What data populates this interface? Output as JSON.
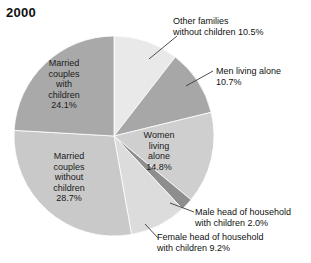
{
  "chart_data": {
    "type": "pie",
    "title": "2000",
    "xlabel": "",
    "ylabel": "",
    "legend_position": "none",
    "grid": false,
    "categories": [
      "Other families without children",
      "Men living alone",
      "Women living alone",
      "Male head of household with children",
      "Female head of household with children",
      "Married couples without children",
      "Married couples with children"
    ],
    "values": [
      10.5,
      10.7,
      14.8,
      2.0,
      9.2,
      28.7,
      24.1
    ],
    "value_suffix": "%",
    "start_angle_deg": 0,
    "direction": "clockwise",
    "center": {
      "x": 114,
      "y": 136
    },
    "radius": 100,
    "slices": [
      {
        "name": "other-families-without-children",
        "label": "Other families\nwithout children 10.5%",
        "value": 10.5,
        "color": "#e9e9e9",
        "label_placement": "callout"
      },
      {
        "name": "men-living-alone",
        "label": "Men living alone\n10.7%",
        "value": 10.7,
        "color": "#a7a7a7",
        "label_placement": "callout"
      },
      {
        "name": "women-living-alone",
        "label": "Women\nliving\nalone\n14.8%",
        "value": 14.8,
        "color": "#cfcfcf",
        "label_placement": "inside"
      },
      {
        "name": "male-head-of-household-with-children",
        "label": "Male head of household\nwith children 2.0%",
        "value": 2.0,
        "color": "#8e8e8e",
        "label_placement": "callout"
      },
      {
        "name": "female-head-of-household-with-children",
        "label": "Female head of household\nwith children 9.2%",
        "value": 9.2,
        "color": "#dcdcdc",
        "label_placement": "callout"
      },
      {
        "name": "married-couples-without-children",
        "label": "Married\ncouples\nwithout\nchildren\n28.7%",
        "value": 28.7,
        "color": "#c9c9c9",
        "label_placement": "inside"
      },
      {
        "name": "married-couples-with-children",
        "label": "Married\ncouples\nwith\nchildren\n24.1%",
        "value": 24.1,
        "color": "#a9a9a9",
        "label_placement": "inside"
      }
    ]
  },
  "colors": {
    "background": "#ffffff",
    "text": "#1a1a1a",
    "slice_outline": "#ffffff",
    "leader_line": "#3a3a3a"
  }
}
